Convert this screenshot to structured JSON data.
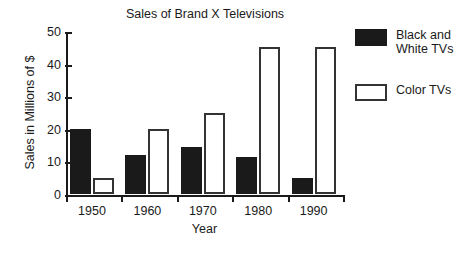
{
  "chart_data": {
    "type": "bar",
    "title": "Sales of Brand X Televisions",
    "xlabel": "Year",
    "ylabel": "Sales in Millions of $",
    "categories": [
      "1950",
      "1960",
      "1970",
      "1980",
      "1990"
    ],
    "series": [
      {
        "name": "Black and White TVs",
        "color": "#1a1a1a",
        "style": "filled",
        "values": [
          20,
          12,
          14.5,
          11.5,
          5
        ]
      },
      {
        "name": "Color TVs",
        "color": "#ffffff",
        "style": "outlined",
        "values": [
          5,
          20,
          25,
          45,
          45
        ]
      }
    ],
    "ylim": [
      0,
      50
    ],
    "yticks": [
      0,
      10,
      20,
      30,
      40,
      50
    ],
    "ytick_labels": [
      "0",
      "10",
      "20",
      "30",
      "40",
      "50"
    ],
    "grid": false,
    "legend_position": "right"
  },
  "legend": {
    "entries": [
      {
        "label_line1": "Black and",
        "label_line2": "White TVs"
      },
      {
        "label_line1": "Color TVs",
        "label_line2": ""
      }
    ]
  }
}
